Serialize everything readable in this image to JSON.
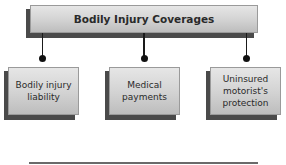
{
  "diagram": {
    "root": {
      "label": "Bodily Injury Coverages"
    },
    "children": [
      {
        "label": "Bodily injury liability"
      },
      {
        "label": "Medical payments"
      },
      {
        "label": "Uninsured motorist's protection"
      }
    ]
  }
}
